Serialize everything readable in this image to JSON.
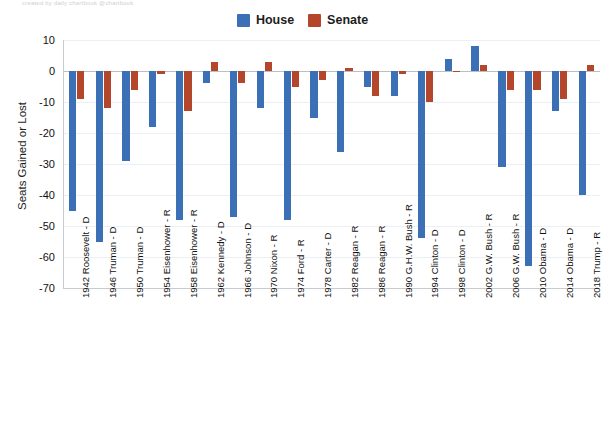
{
  "top_caption": "created by daily chartbook @chartbook",
  "legend": {
    "position": "top-center",
    "items": [
      {
        "label": "House",
        "color": "#3b6fb6",
        "name": "house"
      },
      {
        "label": "Senate",
        "color": "#b4462c",
        "name": "senate"
      }
    ]
  },
  "chart_data": {
    "type": "bar",
    "title": "",
    "subtitle": "",
    "xlabel": "",
    "ylabel": "Seats Gained or Lost",
    "ylim": [
      -70,
      10
    ],
    "yticks": [
      10,
      0,
      -10,
      -20,
      -30,
      -40,
      -50,
      -60,
      -70
    ],
    "ytick_labels": [
      "10",
      "0",
      "-10",
      "-20",
      "-30",
      "-40",
      "-50",
      "-60",
      "-70"
    ],
    "grid": true,
    "grid_axis": "y",
    "legend_position": "top-center",
    "categories": [
      "1942 Roosevelt - D",
      "1946 Truman - D",
      "1950 Truman - D",
      "1954 Eisenhower - R",
      "1958 Eisenhower - R",
      "1962 Kennedy - D",
      "1966 Johnson - D",
      "1970 Nixon - R",
      "1974 Ford - R",
      "1978 Carter - D",
      "1982 Reagan - R",
      "1986 Reagan - R",
      "1990 G.H.W. Bush - R",
      "1994 Clinton - D",
      "1998 Clinton - D",
      "2002 G.W. Bush - R",
      "2006 G.W. Bush - R",
      "2010 Obama - D",
      "2014 Obama - D",
      "2018 Trump - R"
    ],
    "series": [
      {
        "name": "House",
        "color": "#3b6fb6",
        "values": [
          -45,
          -55,
          -29,
          -18,
          -48,
          -4,
          -47,
          -12,
          -48,
          -15,
          -26,
          -5,
          -8,
          -54,
          4,
          8,
          -31,
          -63,
          -13,
          -40
        ]
      },
      {
        "name": "Senate",
        "color": "#b4462c",
        "values": [
          -9,
          -12,
          -6,
          -1,
          -13,
          3,
          -4,
          3,
          -5,
          -3,
          1,
          -8,
          -1,
          -10,
          0,
          2,
          -6,
          -6,
          -9,
          2
        ]
      }
    ]
  }
}
